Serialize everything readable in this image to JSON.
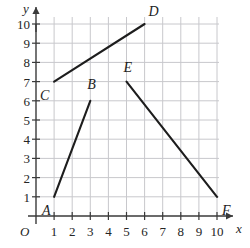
{
  "figure": {
    "origin_label": "O",
    "x_axis_name": "x",
    "y_axis_name": "y",
    "x_ticks": [
      "1",
      "2",
      "3",
      "4",
      "5",
      "6",
      "7",
      "8",
      "9",
      "10"
    ],
    "y_ticks": [
      "1",
      "2",
      "3",
      "4",
      "5",
      "6",
      "7",
      "8",
      "9",
      "10"
    ],
    "grid_color": "#c8c8cc",
    "axis_color": "#3a3a3a",
    "line_color": "#1d1d1d"
  },
  "chart_data": {
    "type": "line",
    "title": "",
    "xlabel": "x",
    "ylabel": "y",
    "xlim": [
      0,
      10
    ],
    "ylim": [
      0,
      10
    ],
    "xticks": [
      1,
      2,
      3,
      4,
      5,
      6,
      7,
      8,
      9,
      10
    ],
    "yticks": [
      1,
      2,
      3,
      4,
      5,
      6,
      7,
      8,
      9,
      10
    ],
    "grid": true,
    "legend": "none",
    "points": [
      {
        "name": "A",
        "x": 1,
        "y": 1,
        "label_dx": -12,
        "label_dy": 14
      },
      {
        "name": "B",
        "x": 3,
        "y": 6,
        "label_dx": -3,
        "label_dy": -16
      },
      {
        "name": "C",
        "x": 1,
        "y": 7,
        "label_dx": -14,
        "label_dy": 14
      },
      {
        "name": "D",
        "x": 6,
        "y": 10,
        "label_dx": 4,
        "label_dy": -12
      },
      {
        "name": "E",
        "x": 5,
        "y": 7,
        "label_dx": -3,
        "label_dy": -14
      },
      {
        "name": "F",
        "x": 10,
        "y": 1,
        "label_dx": 5,
        "label_dy": 14
      }
    ],
    "series": [
      {
        "name": "AB",
        "from": "A",
        "to": "B",
        "x": [
          1,
          3
        ],
        "y": [
          1,
          6
        ]
      },
      {
        "name": "CD",
        "from": "C",
        "to": "D",
        "x": [
          1,
          6
        ],
        "y": [
          7,
          10
        ]
      },
      {
        "name": "EF",
        "from": "E",
        "to": "F",
        "x": [
          5,
          10
        ],
        "y": [
          7,
          1
        ]
      }
    ]
  }
}
